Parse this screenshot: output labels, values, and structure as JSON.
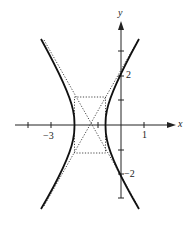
{
  "figure": {
    "type": "hyperbola-graph",
    "axes": {
      "x_label": "x",
      "y_label": "y",
      "x_tick_labels": [
        {
          "value": -3,
          "label": "−3"
        },
        {
          "value": 1,
          "label": "1"
        }
      ],
      "y_tick_labels": [
        {
          "value": 2,
          "label": "2"
        },
        {
          "value": -2,
          "label": "−2"
        }
      ]
    },
    "curve": {
      "description": "Horizontal hyperbola (two branches opening left and right)",
      "style": "solid-bold"
    },
    "asymptotes": {
      "style": "dotted",
      "count": 2
    },
    "central_box": {
      "style": "dotted"
    },
    "colors": {
      "ink": "#222222",
      "background": "#ffffff"
    }
  }
}
